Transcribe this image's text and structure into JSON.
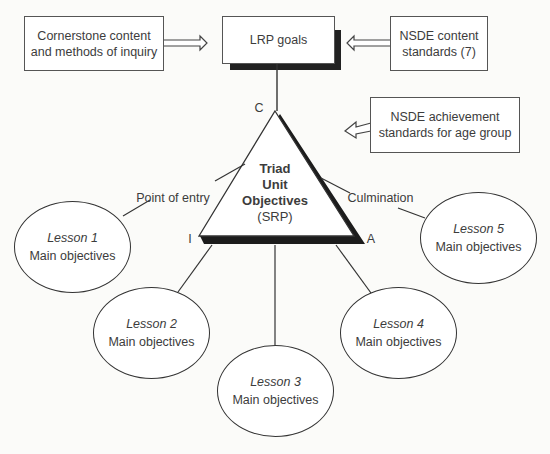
{
  "boxes": {
    "cornerstone": {
      "line1": "Cornerstone content",
      "line2": "and methods of inquiry"
    },
    "lrp": {
      "label": "LRP goals"
    },
    "nsde_content": {
      "line1": "NSDE content",
      "line2": "standards (7)"
    },
    "nsde_achievement": {
      "line1": "NSDE achievement",
      "line2": "standards for age group"
    }
  },
  "triangle": {
    "line1": "Triad",
    "line2": "Unit",
    "line3": "Objectives",
    "line4": "(SRP)",
    "vertex_top": "C",
    "vertex_left": "I",
    "vertex_right": "A"
  },
  "connectors": {
    "entry": "Point of entry",
    "culmination": "Culmination"
  },
  "lessons": [
    {
      "title": "Lesson 1",
      "subtitle": "Main objectives"
    },
    {
      "title": "Lesson 2",
      "subtitle": "Main objectives"
    },
    {
      "title": "Lesson 3",
      "subtitle": "Main objectives"
    },
    {
      "title": "Lesson 4",
      "subtitle": "Main objectives"
    },
    {
      "title": "Lesson 5",
      "subtitle": "Main objectives"
    }
  ]
}
